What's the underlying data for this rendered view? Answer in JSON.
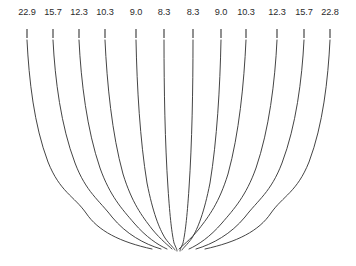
{
  "figure": {
    "width": 356,
    "height": 266,
    "background_color": "#ffffff",
    "line_color": "#3a3a3a",
    "text_color": "#2b2b2b"
  },
  "axis": {
    "position": "top",
    "tick_count": 12,
    "labels": [
      "22.9",
      "15.7",
      "12.3",
      "10.3",
      "9.0",
      "8.3",
      "8.3",
      "9.0",
      "10.3",
      "12.3",
      "15.7",
      "22.8"
    ],
    "label_y": 15,
    "tick_y_start": 29,
    "tick_y_end": 38,
    "tick_x": [
      27,
      53,
      79,
      105,
      136,
      164,
      193,
      221,
      246,
      277,
      304,
      330
    ]
  },
  "chart_data": {
    "type": "line",
    "title": "",
    "xlabel": "",
    "ylabel": "",
    "grid": false,
    "legend": "none",
    "symmetric": true,
    "convergence_point": {
      "x": 178,
      "y": 250
    },
    "series": [
      {
        "name": "streamline-1",
        "label": "22.9",
        "start": {
          "x": 27,
          "y": 40
        },
        "path": "M27,40 C29,80 34,125 48,162 C60,192 74,196 86,213 C98,231 120,242 152,249"
      },
      {
        "name": "streamline-2",
        "label": "15.7",
        "start": {
          "x": 53,
          "y": 40
        },
        "path": "M53,40 C55,80 61,126 75,163 C86,192 99,200 112,217 C126,234 144,244 161,249"
      },
      {
        "name": "streamline-3",
        "label": "12.3",
        "start": {
          "x": 79,
          "y": 40
        },
        "path": "M79,40 C81,82 87,130 100,168 C110,196 122,209 134,223 C146,237 158,245 167,249"
      },
      {
        "name": "streamline-4",
        "label": "10.3",
        "start": {
          "x": 105,
          "y": 40
        },
        "path": "M105,40 C107,84 112,134 123,174 C132,203 142,216 152,229 C161,240 169,246 172,249"
      },
      {
        "name": "streamline-5",
        "label": "9.0",
        "start": {
          "x": 136,
          "y": 40
        },
        "path": "M136,40 C137,88 140,140 147,183 C153,213 159,228 165,238 C170,245 174,248 175,250"
      },
      {
        "name": "streamline-6",
        "label": "8.3",
        "start": {
          "x": 164,
          "y": 40
        },
        "path": "M164,40 C164,90 165,143 168,188 C170,219 172,234 174,243 C176,248 177,249 177,251"
      },
      {
        "name": "streamline-7",
        "label": "8.3",
        "start": {
          "x": 193,
          "y": 40
        },
        "path": "M193,40 C193,90 192,143 189,188 C187,219 185,234 183,243 C181,248 180,249 180,251"
      },
      {
        "name": "streamline-8",
        "label": "9.0",
        "start": {
          "x": 221,
          "y": 40
        },
        "path": "M221,40 C220,88 217,140 210,183 C204,213 198,228 192,238 C187,245 183,248 182,250"
      },
      {
        "name": "streamline-9",
        "label": "10.3",
        "start": {
          "x": 246,
          "y": 40
        },
        "path": "M246,40 C244,84 239,134 228,174 C219,203 209,216 199,229 C190,240 182,246 179,249"
      },
      {
        "name": "streamline-10",
        "label": "12.3",
        "start": {
          "x": 277,
          "y": 40
        },
        "path": "M277,40 C275,82 269,130 256,168 C246,196 234,209 222,223 C210,237 198,245 189,249"
      },
      {
        "name": "streamline-11",
        "label": "15.7",
        "start": {
          "x": 304,
          "y": 40
        },
        "path": "M304,40 C302,80 296,126 282,163 C271,192 258,200 245,217 C231,234 213,244 196,249"
      },
      {
        "name": "streamline-12",
        "label": "22.8",
        "start": {
          "x": 330,
          "y": 40
        },
        "path": "M330,40 C328,80 323,125 309,162 C297,192 283,196 271,213 C259,231 237,242 205,249"
      }
    ]
  }
}
